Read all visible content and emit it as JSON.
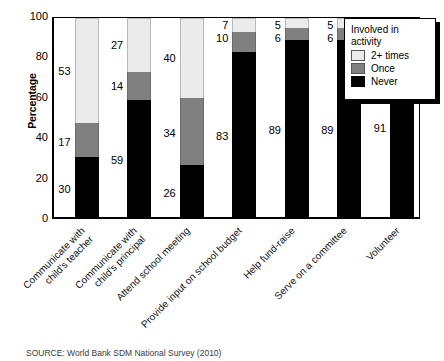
{
  "chart_data": {
    "type": "bar",
    "subtype": "stacked-bar-100",
    "title": "",
    "xlabel": "",
    "ylabel": "Percentage",
    "ylim": [
      0,
      100
    ],
    "yticks": [
      0,
      20,
      40,
      60,
      80,
      100
    ],
    "grid": false,
    "legend": {
      "position": "top-right",
      "title_line1": "Involved in",
      "title_line2": "activity",
      "entries": [
        {
          "name": "2+ times",
          "color": "#ebebeb"
        },
        {
          "name": "Once",
          "color": "#808080"
        },
        {
          "name": "Never",
          "color": "#000000"
        }
      ]
    },
    "categories": [
      "Communicate with child's teacher",
      "Communicate with child's principal",
      "Attend school meeting",
      "Provide input on school budget",
      "Help fund-raise",
      "Serve on a committee",
      "Volunteer"
    ],
    "category_lines": [
      [
        "Communicate with",
        "child's teacher"
      ],
      [
        "Communicate with",
        "child's principal"
      ],
      [
        "Attend school meeting",
        ""
      ],
      [
        "Provide input on school budget",
        ""
      ],
      [
        "Help fund-raise",
        ""
      ],
      [
        "Serve on a committee",
        ""
      ],
      [
        "Volunteer",
        ""
      ]
    ],
    "series": [
      {
        "name": "Never",
        "color": "#000000",
        "values": [
          30,
          59,
          26,
          83,
          89,
          89,
          91
        ]
      },
      {
        "name": "Once",
        "color": "#808080",
        "values": [
          17,
          14,
          34,
          10,
          6,
          6,
          3
        ]
      },
      {
        "name": "2+ times",
        "color": "#ebebeb",
        "values": [
          53,
          27,
          40,
          7,
          5,
          5,
          6
        ]
      }
    ]
  },
  "source": {
    "note": "SOURCE: World Bank SDM National Survey (2010)"
  }
}
